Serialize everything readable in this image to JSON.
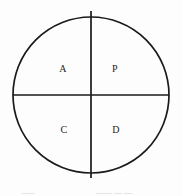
{
  "figure": {
    "name": "quadrant-circle-diagram",
    "background_color": "#fdfdfd",
    "stroke_color": "#1a1a1a",
    "label_color": "#1d1d1d",
    "circle": {
      "center_x": 91,
      "center_y": 95,
      "radius": 78,
      "stroke_width": 1.7
    },
    "dividers": {
      "vertical": {
        "x": 91,
        "y_top": 11,
        "y_bottom": 178,
        "stroke_width": 1.7
      },
      "horizontal": {
        "y": 95,
        "x_left": 13,
        "x_right": 169,
        "stroke_width": 1.7
      }
    },
    "quadrants": [
      {
        "id": "top-left",
        "label": "A"
      },
      {
        "id": "top-right",
        "label": "P"
      },
      {
        "id": "bottom-left",
        "label": "C"
      },
      {
        "id": "bottom-right",
        "label": "D"
      }
    ]
  },
  "caption": {
    "left_fragment": "___",
    "right_fragment": "____ __ __"
  }
}
